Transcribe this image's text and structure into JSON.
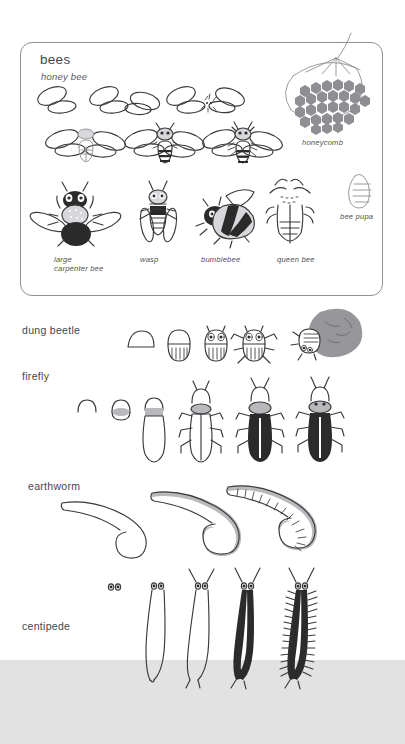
{
  "page": {
    "type": "how-to-draw instructional sheet",
    "background_color": "#ffffff",
    "ground_band_color": "#e2e2e2"
  },
  "bees_panel": {
    "heading": "bees",
    "subheading": "honey bee",
    "honeycomb_label": "honeycomb",
    "pupa_label": "bee pupa",
    "captions": [
      {
        "id": "carpenter",
        "line1": "large",
        "line2": "carpenter bee"
      },
      {
        "id": "wasp",
        "line1": "wasp",
        "line2": ""
      },
      {
        "id": "bumblebee",
        "line1": "bumblebee",
        "line2": ""
      },
      {
        "id": "queen",
        "line1": "queen bee",
        "line2": ""
      }
    ]
  },
  "sections": [
    {
      "id": "dung-beetle",
      "label": "dung beetle",
      "steps": 5
    },
    {
      "id": "firefly",
      "label": "firefly",
      "steps": 6
    },
    {
      "id": "earthworm",
      "label": "earthworm",
      "steps": 3
    },
    {
      "id": "centipede",
      "label": "centipede",
      "steps": 5
    }
  ],
  "colors": {
    "ink": "#3a3a3a",
    "light_ink": "#8e8e93",
    "gray_fill": "#b9b9bd",
    "dark_fill": "#2b2b2b",
    "panel_border": "#8d8d94",
    "text": "#46464b"
  }
}
